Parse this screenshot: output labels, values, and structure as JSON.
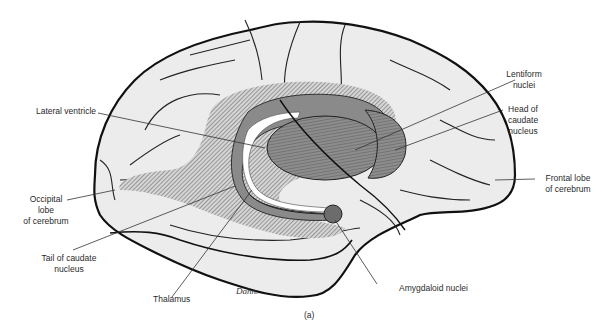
{
  "figure": {
    "subfigure_label": "(a)",
    "signature": "Dahn.",
    "colors": {
      "background": "#ffffff",
      "brain_fill": "#ececec",
      "outline": "#111111",
      "nuclei_fill": "#8a8a8a",
      "nuclei_dark": "#6c6c6c",
      "ventricle_hatch": "#9a9a9a",
      "label_text": "#2a2a2a"
    }
  },
  "labels": {
    "lateral_ventricle": "Lateral ventricle",
    "lentiform_nuclei": [
      "Lentiform",
      "nuclei"
    ],
    "head_of_caudate": [
      "Head of",
      "caudate",
      "nucleus"
    ],
    "frontal_lobe": [
      "Frontal lobe",
      "of cerebrum"
    ],
    "occipital_lobe": [
      "Occipital",
      "lobe",
      "of cerebrum"
    ],
    "tail_of_caudate": [
      "Tail of caudate",
      "nucleus"
    ],
    "thalamus": "Thalamus",
    "amygdaloid_nuclei": "Amygdaloid nuclei"
  }
}
